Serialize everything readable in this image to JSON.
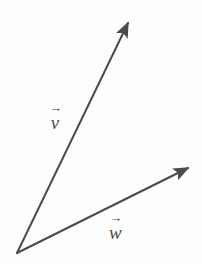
{
  "figure": {
    "width": 202,
    "height": 264,
    "background_color": "#fdfdfc",
    "stroke_color": "#4a4a50",
    "stroke_width": 2,
    "origin": {
      "x": 17,
      "y": 253
    }
  },
  "vectors": [
    {
      "id": "v",
      "label": "v",
      "accent": "→",
      "start": {
        "x": 17,
        "y": 253
      },
      "end": {
        "x": 128,
        "y": 23
      },
      "arrowhead": "filled-triangle",
      "label_position": {
        "x": 49,
        "y": 104
      }
    },
    {
      "id": "w",
      "label": "w",
      "accent": "→",
      "start": {
        "x": 17,
        "y": 253
      },
      "end": {
        "x": 188,
        "y": 168
      },
      "arrowhead": "filled-triangle",
      "label_position": {
        "x": 109,
        "y": 214
      }
    }
  ]
}
